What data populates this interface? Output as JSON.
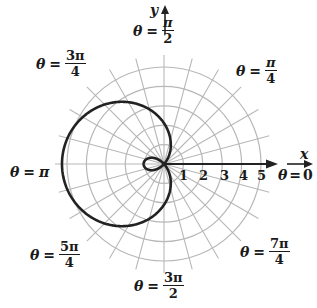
{
  "figure": {
    "axes": {
      "x_label": "x",
      "y_label": "y"
    },
    "radial_ticks": [
      "1",
      "2",
      "3",
      "4",
      "5"
    ],
    "angle_labels": {
      "theta_0": {
        "lhs": "θ",
        "eq": "=",
        "value": "0"
      },
      "theta_pi_4": {
        "lhs": "θ",
        "eq": "=",
        "num": "π",
        "den": "4"
      },
      "theta_pi_2": {
        "lhs": "θ",
        "eq": "=",
        "num": "π",
        "den": "2"
      },
      "theta_3pi_4": {
        "lhs": "θ",
        "eq": "=",
        "num": "3π",
        "den": "4"
      },
      "theta_pi": {
        "lhs": "θ",
        "eq": "=",
        "value": "π"
      },
      "theta_5pi_4": {
        "lhs": "θ",
        "eq": "=",
        "num": "5π",
        "den": "4"
      },
      "theta_3pi_2": {
        "lhs": "θ",
        "eq": "=",
        "num": "3π",
        "den": "2"
      },
      "theta_7pi_4": {
        "lhs": "θ",
        "eq": "=",
        "num": "7π",
        "den": "4"
      }
    },
    "grid": {
      "circles": 5,
      "spoke_step_deg": 15,
      "color": "#b8b8b8"
    },
    "curve": {
      "a": 2,
      "b": -3,
      "form": "r = a + b cos(theta)",
      "color": "#222222"
    }
  }
}
